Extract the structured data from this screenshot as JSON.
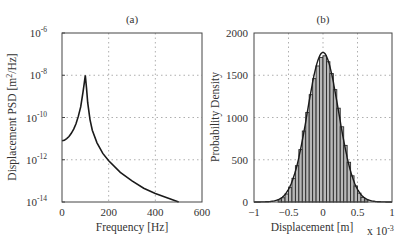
{
  "chart_data": [
    {
      "type": "line",
      "title": "(a)",
      "xlabel": "Frequency [Hz]",
      "ylabel": "Displacement PSD [m^2/Hz]",
      "yscale": "log",
      "xlim": [
        0,
        600
      ],
      "ylim": [
        1e-14,
        1e-06
      ],
      "x_ticks": [
        "0",
        "200",
        "400",
        "600"
      ],
      "y_ticks": [
        "10^-14",
        "10^-12",
        "10^-10",
        "10^-8",
        "10^-6"
      ],
      "grid": true,
      "series": [
        {
          "name": "PSD",
          "x": [
            0,
            10,
            20,
            30,
            40,
            50,
            60,
            70,
            80,
            90,
            95,
            100,
            105,
            110,
            120,
            130,
            150,
            175,
            200,
            250,
            300,
            350,
            400,
            450,
            500
          ],
          "log10_y": [
            -11.1,
            -11.08,
            -11.0,
            -10.9,
            -10.75,
            -10.55,
            -10.3,
            -9.95,
            -9.5,
            -8.8,
            -8.4,
            -8.0,
            -8.6,
            -9.3,
            -10.1,
            -10.6,
            -11.2,
            -11.7,
            -12.05,
            -12.6,
            -13.0,
            -13.35,
            -13.6,
            -13.8,
            -14.0
          ]
        }
      ]
    },
    {
      "type": "bar",
      "title": "(b)",
      "xlabel": "Displacement [m]",
      "x_multiplier": "x 10^-3",
      "ylabel": "Probability Density",
      "xlim": [
        -1,
        1
      ],
      "ylim": [
        0,
        2000
      ],
      "x_ticks": [
        "-1",
        "-0.5",
        "0",
        "0.5",
        "1"
      ],
      "y_ticks": [
        "0",
        "500",
        "1000",
        "1500",
        "2000"
      ],
      "grid": true,
      "histogram": {
        "bin_width": 0.05,
        "bin_centers": [
          -0.625,
          -0.575,
          -0.525,
          -0.475,
          -0.425,
          -0.375,
          -0.325,
          -0.275,
          -0.225,
          -0.175,
          -0.125,
          -0.075,
          -0.025,
          0.025,
          0.075,
          0.125,
          0.175,
          0.225,
          0.275,
          0.325,
          0.375,
          0.425,
          0.475,
          0.525,
          0.575,
          0.625
        ],
        "values": [
          25,
          50,
          95,
          170,
          280,
          430,
          620,
          840,
          1060,
          1270,
          1460,
          1610,
          1710,
          1730,
          1660,
          1520,
          1330,
          1110,
          890,
          670,
          470,
          310,
          190,
          105,
          55,
          25
        ]
      },
      "fit_curve": {
        "type": "gaussian",
        "mean": 0,
        "std": 0.225,
        "peak": 1770
      }
    }
  ],
  "panel_a": {
    "title": "(a)",
    "xlabel": "Frequency [Hz]",
    "ylabel_main": "Displacement PSD [m",
    "ylabel_sup": "2",
    "ylabel_tail": "/Hz]",
    "x_ticks": [
      "0",
      "200",
      "400",
      "600"
    ],
    "y_tick_base": "10",
    "y_tick_exps": [
      "-6",
      "-8",
      "-10",
      "-12",
      "-14"
    ]
  },
  "panel_b": {
    "title": "(b)",
    "xlabel": "Displacement [m]",
    "x_multiplier_base": "x 10",
    "x_multiplier_exp": "-3",
    "ylabel": "Probability Density",
    "x_ticks": [
      "-1",
      "-0.5",
      "0",
      "0.5",
      "1"
    ],
    "y_ticks": [
      "2000",
      "1500",
      "1000",
      "500",
      "0"
    ]
  }
}
